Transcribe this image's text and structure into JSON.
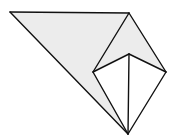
{
  "diagram": {
    "width": 178,
    "height": 139,
    "colors": {
      "background": "#ffffff",
      "shaded_fill": "#ececec",
      "unshaded_fill": "#ffffff",
      "stroke": "#111111"
    },
    "stroke_width": 1.4,
    "vertices": {
      "A_top_left": [
        10,
        12
      ],
      "B_top_right": [
        129,
        13
      ],
      "C_right": [
        166,
        72
      ],
      "D_bottom": [
        128,
        134
      ],
      "E_inner_left": [
        93,
        72
      ],
      "F_inner_top": [
        129,
        54
      ]
    },
    "shaded_polygon": "10,12 129,13 166,72 129,54 93,72 128,134",
    "white_kite": "93,72 129,54 166,72 128,134",
    "edges": [
      "10,12 129,13",
      "129,13 166,72",
      "166,72 128,134",
      "128,134 10,12",
      "129,13 93,72",
      "93,72 128,134",
      "93,72 129,54",
      "129,54 166,72",
      "129,54 128,134"
    ]
  }
}
